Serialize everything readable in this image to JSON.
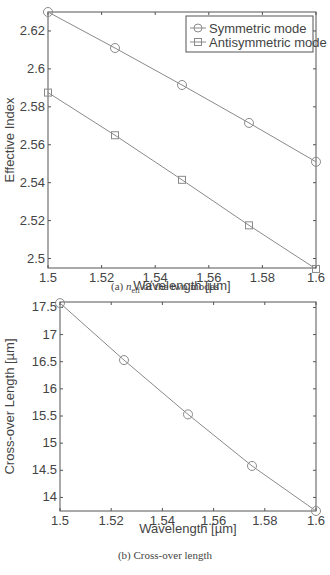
{
  "chart_data": [
    {
      "type": "line",
      "title": "",
      "xlabel": "Wavelength [µm]",
      "ylabel": "Effective Index",
      "xlim": [
        1.5,
        1.6
      ],
      "ylim": [
        2.495,
        2.63
      ],
      "xticks": [
        1.5,
        1.52,
        1.54,
        1.56,
        1.58,
        1.6
      ],
      "xtick_labels": [
        "1.5",
        "1.52",
        "1.54",
        "1.56",
        "1.58",
        "1.6"
      ],
      "yticks": [
        2.5,
        2.52,
        2.54,
        2.56,
        2.58,
        2.6,
        2.62
      ],
      "ytick_labels": [
        "2.5",
        "2.52",
        "2.54",
        "2.56",
        "2.58",
        "2.6",
        "2.62"
      ],
      "grid": false,
      "legend_position": "upper right",
      "x": [
        1.5,
        1.525,
        1.55,
        1.575,
        1.6
      ],
      "series": [
        {
          "name": "Symmetric mode",
          "marker": "circle",
          "values": [
            2.63,
            2.611,
            2.5915,
            2.5715,
            2.551
          ]
        },
        {
          "name": "Antisymmetric mode",
          "marker": "square",
          "values": [
            2.5875,
            2.565,
            2.5415,
            2.5175,
            2.4945
          ]
        }
      ],
      "caption": "(a) n_eff of the two modes"
    },
    {
      "type": "line",
      "title": "",
      "xlabel": "Wavelength [µm]",
      "ylabel": "Cross-over Length [µm]",
      "xlim": [
        1.5,
        1.6
      ],
      "ylim": [
        13.75,
        17.6
      ],
      "xticks": [
        1.5,
        1.52,
        1.54,
        1.56,
        1.58,
        1.6
      ],
      "xtick_labels": [
        "1.5",
        "1.52",
        "1.54",
        "1.56",
        "1.58",
        "1.6"
      ],
      "yticks": [
        14,
        14.5,
        15,
        15.5,
        16,
        16.5,
        17,
        17.5
      ],
      "ytick_labels": [
        "14",
        "14.5",
        "15",
        "15.5",
        "16",
        "16.5",
        "17",
        "17.5"
      ],
      "grid": false,
      "x": [
        1.5,
        1.525,
        1.55,
        1.575,
        1.6
      ],
      "series": [
        {
          "name": "Cross-over length",
          "marker": "circle",
          "values": [
            17.58,
            16.53,
            15.53,
            14.58,
            13.75
          ]
        }
      ],
      "caption": "(b) Cross-over length"
    }
  ],
  "captions": {
    "a_prefix": "(a) ",
    "a_n": "n",
    "a_sub": "eff",
    "a_rest": " of the two modes",
    "b": "(b) Cross-over length"
  },
  "footer_text": "...length dependence of the effective index and the cross-over length...",
  "colors": {
    "line": "#8a8a8a",
    "axis": "#555555",
    "text": "#444444"
  }
}
